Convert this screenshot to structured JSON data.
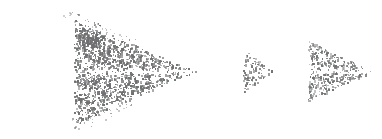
{
  "canvas": {
    "width": 382,
    "height": 139,
    "background": "#ffffff"
  },
  "palette": {
    "stroke": "#7f7f80",
    "stroke_light": "#999a9b",
    "stipple": "#6e6f70",
    "dot_fill": "#7a7b7c",
    "background": "#ffffff"
  },
  "diagram": {
    "type": "technical-line-art",
    "axis": {
      "name": "horizontal-axis-line",
      "y": 71,
      "x_start": 33,
      "x_end": 378,
      "stroke_width": 2.6,
      "color": "#7f7f80"
    },
    "source_dot": {
      "name": "source-point-dot",
      "cx": 23,
      "cy": 70,
      "r": 4.2,
      "color": "#7a7b7c"
    },
    "source_circle": {
      "name": "source-circle-outline",
      "cx": 61,
      "cy": 70,
      "r": 30,
      "stroke_width": 1.6,
      "fill": "none",
      "color": "#8a8b8c"
    },
    "spray_cone": {
      "name": "stippled-spray-cone",
      "apex_x": 196,
      "apex_y": 71,
      "base_x": 74,
      "base_top_y": 19,
      "base_bottom_y": 123,
      "dot_count": 1500,
      "dot_color": "#6e6f70"
    },
    "spike_cluster": {
      "name": "dense-spike-cluster",
      "x": 78,
      "y": 22,
      "width": 22,
      "height": 24
    },
    "small_triangle": {
      "name": "small-stippled-arrowhead",
      "left_x": 241,
      "top_y": 45,
      "bottom_y": 96,
      "apex_x": 277,
      "apex_y": 71,
      "stroke_width": 1.4,
      "dot_count": 150
    },
    "tick_arc": {
      "name": "short-vertical-tick-arc",
      "x": 277,
      "y_top": 52,
      "y_bottom": 90,
      "stroke_width": 1.5
    },
    "vertical_reference_line": {
      "name": "vertical-reference-line",
      "x": 288,
      "y_top": 17,
      "y_bottom": 122,
      "stroke_width": 1.8
    },
    "top_dot": {
      "name": "top-endpoint-dot",
      "cx": 288,
      "cy": 14,
      "r": 4.5,
      "color": "#7a7b7c"
    },
    "bottom_dot": {
      "name": "bottom-endpoint-dot",
      "cx": 288,
      "cy": 124,
      "r": 4.5,
      "color": "#7a7b7c"
    },
    "large_triangle": {
      "name": "large-stippled-arrowhead",
      "left_x": 306,
      "top_y": 37,
      "bottom_y": 104,
      "apex_x": 376,
      "apex_y": 71,
      "stroke_width": 1.6,
      "dot_count": 520
    }
  }
}
